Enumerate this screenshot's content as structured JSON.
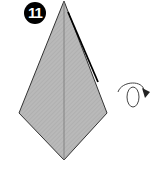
{
  "step": {
    "number": "11"
  },
  "diagram": {
    "shape": "kite",
    "fill_color": "#b8b8b8",
    "stroke_color": "#222222",
    "points": {
      "top": [
        64,
        1
      ],
      "left": [
        19,
        113
      ],
      "right": [
        107,
        113
      ],
      "bottom": [
        64,
        160
      ]
    },
    "center_crease": true
  },
  "symbols": [
    {
      "type": "turn-over-arrow",
      "position": [
        118,
        82
      ]
    }
  ]
}
